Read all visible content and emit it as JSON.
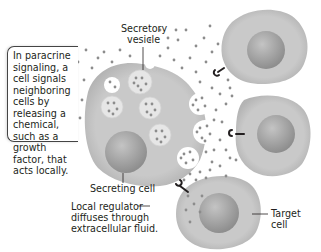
{
  "title": "Paracrine signaling",
  "callout": {
    "lines": [
      "In paracrine",
      "signaling, a",
      "cell signals",
      "neighboring",
      "cells by",
      "releasing a",
      "chemical,",
      "such as a",
      "growth",
      "factor, that",
      "acts locally."
    ]
  },
  "labels": {
    "secretory_vesicle": [
      "Secretory",
      "vesicle"
    ],
    "secreting_cell": "Secreting cell",
    "local_regulator": [
      "Local regulator",
      "diffuses through",
      "extracellular fluid."
    ],
    "target_cell": [
      "Target",
      "cell"
    ]
  },
  "colors": {
    "cell_fill": "#c8c8c8",
    "cell_edge": "#b5b5b5",
    "nucleus": "#a8a8a8",
    "vesicle": "#e4e4e4",
    "molecule": "#8c8c8c",
    "receptor": "#231f20",
    "text": "#231f20"
  }
}
